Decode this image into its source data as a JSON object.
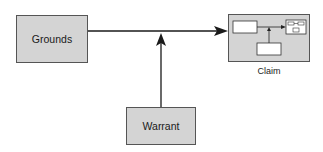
{
  "diagram": {
    "nodes": {
      "grounds": {
        "label": "Grounds"
      },
      "warrant": {
        "label": "Warrant"
      },
      "claim": {
        "label": "Claim"
      }
    },
    "edges": [
      {
        "from": "grounds",
        "to": "claim",
        "type": "arrow"
      },
      {
        "from": "warrant",
        "to": "grounds-claim-link",
        "type": "arrow"
      }
    ],
    "colors": {
      "box_fill": "#d4d4d4",
      "stroke": "#1a1a1a",
      "inner_box_fill": "#ffffff"
    }
  }
}
